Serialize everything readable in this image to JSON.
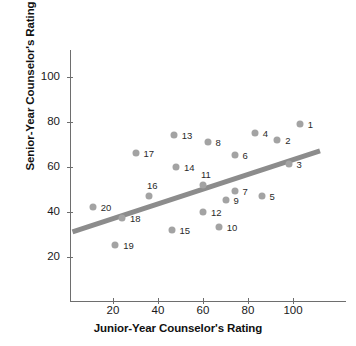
{
  "chart_data": {
    "type": "scatter",
    "title": "",
    "xlabel": "Junior-Year Counselor's Rating",
    "ylabel": "Senior-Year Counselor's Rating",
    "xlim": [
      0,
      118
    ],
    "ylim": [
      0,
      112
    ],
    "xticks": [
      20,
      40,
      60,
      80,
      100
    ],
    "yticks": [
      20,
      40,
      60,
      80,
      100
    ],
    "grid": false,
    "legend": null,
    "point_color": "#a3a3a3",
    "trendline_color": "#8c8c8c",
    "trendline": {
      "visible": true,
      "x_start": 2,
      "y_start": 31,
      "x_end": 112,
      "y_end": 67
    },
    "points": [
      {
        "label": "1",
        "x": 103,
        "y": 79,
        "label_dx": 8,
        "label_dy": 0
      },
      {
        "label": "2",
        "x": 93,
        "y": 72,
        "label_dx": 8,
        "label_dy": 0
      },
      {
        "label": "3",
        "x": 98,
        "y": 61,
        "label_dx": 8,
        "label_dy": 0
      },
      {
        "label": "4",
        "x": 83,
        "y": 75,
        "label_dx": 8,
        "label_dy": 0
      },
      {
        "label": "5",
        "x": 86,
        "y": 47,
        "label_dx": 8,
        "label_dy": 0
      },
      {
        "label": "6",
        "x": 74,
        "y": 65,
        "label_dx": 8,
        "label_dy": 0
      },
      {
        "label": "7",
        "x": 74,
        "y": 49,
        "label_dx": 8,
        "label_dy": 0
      },
      {
        "label": "8",
        "x": 62,
        "y": 71,
        "label_dx": 8,
        "label_dy": 0
      },
      {
        "label": "9",
        "x": 70,
        "y": 45,
        "label_dx": 8,
        "label_dy": 0
      },
      {
        "label": "10",
        "x": 67,
        "y": 33,
        "label_dx": 8,
        "label_dy": 0
      },
      {
        "label": "11",
        "x": 60,
        "y": 52,
        "label_dx": -2,
        "label_dy": -11
      },
      {
        "label": "12",
        "x": 60,
        "y": 40,
        "label_dx": 8,
        "label_dy": 0
      },
      {
        "label": "13",
        "x": 47,
        "y": 74,
        "label_dx": 8,
        "label_dy": 0
      },
      {
        "label": "14",
        "x": 48,
        "y": 60,
        "label_dx": 8,
        "label_dy": 0
      },
      {
        "label": "15",
        "x": 46,
        "y": 32,
        "label_dx": 8,
        "label_dy": 0
      },
      {
        "label": "16",
        "x": 36,
        "y": 47,
        "label_dx": -2,
        "label_dy": -11
      },
      {
        "label": "17",
        "x": 30,
        "y": 66,
        "label_dx": 8,
        "label_dy": 0
      },
      {
        "label": "18",
        "x": 24,
        "y": 37,
        "label_dx": 8,
        "label_dy": 0
      },
      {
        "label": "19",
        "x": 21,
        "y": 25,
        "label_dx": 8,
        "label_dy": 0
      },
      {
        "label": "20",
        "x": 11,
        "y": 42,
        "label_dx": 8,
        "label_dy": 0
      }
    ]
  },
  "axes": {
    "x_title": "Junior-Year Counselor's Rating",
    "y_title": "Senior-Year Counselor's Rating",
    "x_tick_labels": [
      "20",
      "40",
      "60",
      "80",
      "100"
    ],
    "y_tick_labels": [
      "20",
      "40",
      "60",
      "80",
      "100"
    ]
  }
}
